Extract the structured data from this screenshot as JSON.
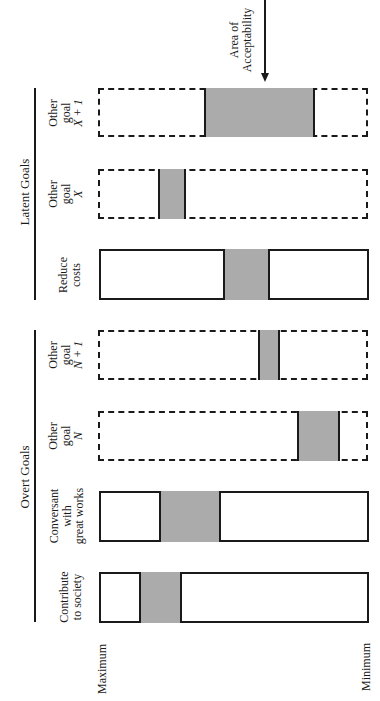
{
  "diagram": {
    "annotation": {
      "line1": "Area of",
      "line2": "Acceptability"
    },
    "groups": [
      {
        "label": "Latent Goals"
      },
      {
        "label": "Overt Goals"
      }
    ],
    "axis": {
      "max_label": "Maximum",
      "min_label": "Minimum"
    },
    "goals": [
      {
        "line1": "Other",
        "line2": "goal",
        "line3": "X + 1",
        "style": "dashed",
        "group": "Latent Goals",
        "acceptable_range_pct": [
          39,
          80
        ]
      },
      {
        "line1": "Other",
        "line2": "goal",
        "line3": "X",
        "style": "dashed",
        "group": "Latent Goals",
        "acceptable_range_pct": [
          22,
          32
        ]
      },
      {
        "line1": "Reduce",
        "line2": "costs",
        "line3": "",
        "style": "solid",
        "group": "Latent Goals",
        "acceptable_range_pct": [
          46,
          63
        ]
      },
      {
        "line1": "Other",
        "line2": "goal",
        "line3": "N + 1",
        "style": "dashed",
        "group": "Overt Goals",
        "acceptable_range_pct": [
          60,
          67
        ]
      },
      {
        "line1": "Other",
        "line2": "goal",
        "line3": "N",
        "style": "dashed",
        "group": "Overt Goals",
        "acceptable_range_pct": [
          74,
          89
        ]
      },
      {
        "line1": "Conversant",
        "line2": "with",
        "line3": "great works",
        "style": "solid",
        "group": "Overt Goals",
        "acceptable_range_pct": [
          23,
          45
        ]
      },
      {
        "line1": "Contribute",
        "line2": "to society",
        "line3": "",
        "style": "solid",
        "group": "Overt Goals",
        "acceptable_range_pct": [
          15,
          31
        ]
      }
    ]
  }
}
